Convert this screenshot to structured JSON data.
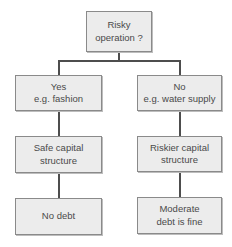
{
  "diagram": {
    "type": "decision-tree",
    "root": {
      "line1": "Risky",
      "line2": "operation ?"
    },
    "branches": [
      {
        "answer": {
          "line1": "Yes",
          "line2": "e.g. fashion"
        },
        "structure": {
          "line1": "Safe capital",
          "line2": "structure"
        },
        "outcome": {
          "line1": "No debt",
          "line2": ""
        }
      },
      {
        "answer": {
          "line1": "No",
          "line2": "e.g. water supply"
        },
        "structure": {
          "line1": "Riskier capital",
          "line2": "structure"
        },
        "outcome": {
          "line1": "Moderate",
          "line2": "debt is fine"
        }
      }
    ],
    "colors": {
      "box_fill": "#ececec",
      "box_border": "#8a8a8a",
      "connector": "#4d4d4d",
      "text": "#4a4a4a"
    }
  }
}
